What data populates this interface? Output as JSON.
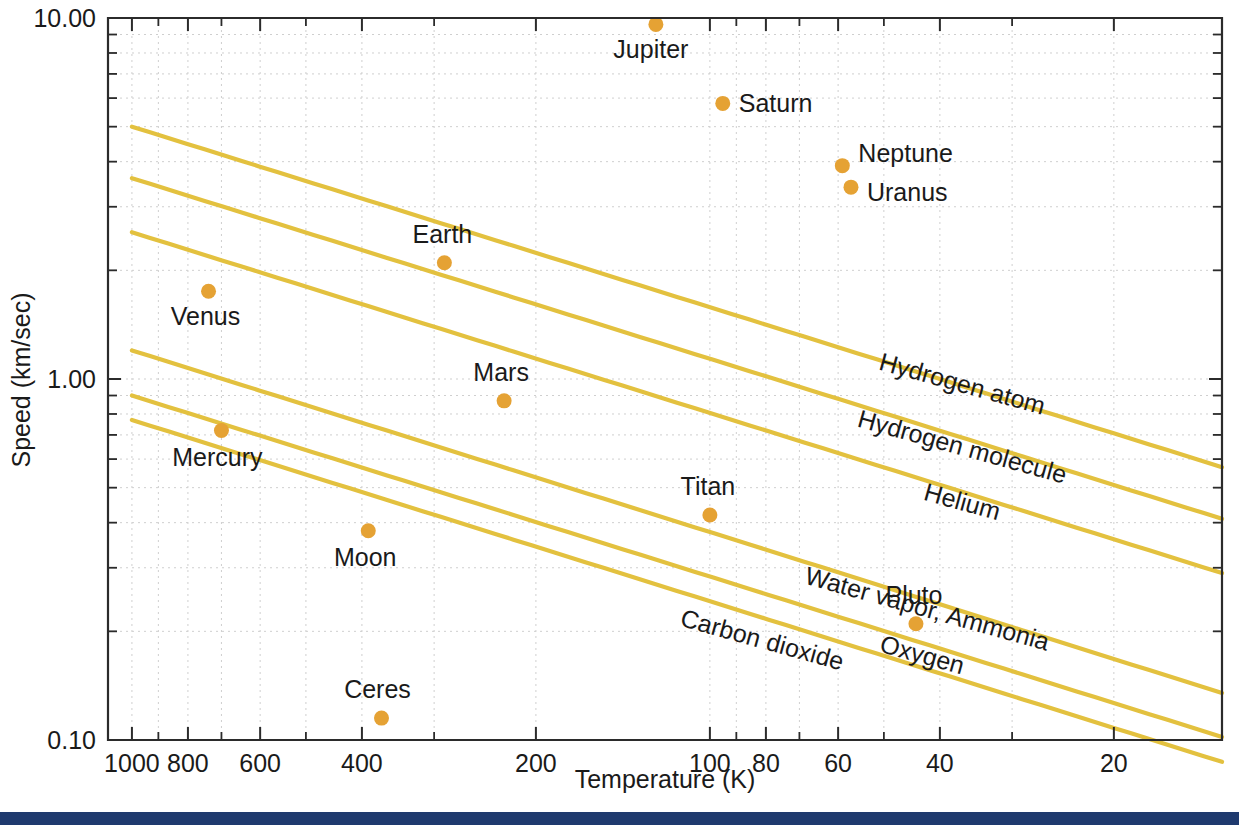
{
  "figure": {
    "background_color": "#ffffff",
    "footer_bar_color": "#1f3a6e",
    "dot_color": "#e5a234",
    "line_color": "#e3c13f",
    "axis_color": "#2b2b2b",
    "grid_color": "#cfcfcf"
  },
  "chart_data": {
    "type": "scatter",
    "title": "",
    "xlabel": "Temperature (K)",
    "ylabel": "Speed (km/sec)",
    "xscale": "log",
    "yscale": "log",
    "x_reversed": true,
    "xlim": [
      1100,
      13
    ],
    "ylim": [
      0.1,
      10.0
    ],
    "grid": true,
    "legend_position": "inline-curve-labels",
    "x_tick_labels": [
      "1000",
      "800",
      "600",
      "400",
      "200",
      "100",
      "80",
      "60",
      "40",
      "20"
    ],
    "x_tick_values": [
      1000,
      800,
      600,
      400,
      200,
      100,
      80,
      60,
      40,
      20
    ],
    "y_tick_labels": [
      "10.00",
      "1.00",
      "0.10"
    ],
    "y_tick_values": [
      10.0,
      1.0,
      0.1
    ],
    "y_minor_ticks": [
      9,
      8,
      7,
      6,
      5,
      4,
      3,
      2,
      0.9,
      0.8,
      0.7,
      0.6,
      0.5,
      0.4,
      0.3,
      0.2
    ],
    "points": [
      {
        "name": "Jupiter",
        "temperature": 124,
        "speed": 9.6,
        "label_dx": -5,
        "label_dy": 34,
        "label_anchor": "middle"
      },
      {
        "name": "Saturn",
        "temperature": 95,
        "speed": 5.8,
        "label_dx": 16,
        "label_dy": 9,
        "label_anchor": "start"
      },
      {
        "name": "Neptune",
        "temperature": 59,
        "speed": 3.9,
        "label_dx": 16,
        "label_dy": -4,
        "label_anchor": "start"
      },
      {
        "name": "Uranus",
        "temperature": 57,
        "speed": 3.4,
        "label_dx": 16,
        "label_dy": 14,
        "label_anchor": "start"
      },
      {
        "name": "Earth",
        "temperature": 288,
        "speed": 2.1,
        "label_dx": -2,
        "label_dy": -20,
        "label_anchor": "middle"
      },
      {
        "name": "Venus",
        "temperature": 737,
        "speed": 1.75,
        "label_dx": -3,
        "label_dy": 34,
        "label_anchor": "middle"
      },
      {
        "name": "Mercury",
        "temperature": 700,
        "speed": 0.72,
        "label_dx": -4,
        "label_dy": 35,
        "label_anchor": "middle"
      },
      {
        "name": "Mars",
        "temperature": 227,
        "speed": 0.87,
        "label_dx": -3,
        "label_dy": -20,
        "label_anchor": "middle"
      },
      {
        "name": "Titan",
        "temperature": 100,
        "speed": 0.42,
        "label_dx": -2,
        "label_dy": -20,
        "label_anchor": "middle"
      },
      {
        "name": "Moon",
        "temperature": 390,
        "speed": 0.38,
        "label_dx": -3,
        "label_dy": 35,
        "label_anchor": "middle"
      },
      {
        "name": "Pluto",
        "temperature": 44,
        "speed": 0.21,
        "label_dx": -2,
        "label_dy": -20,
        "label_anchor": "middle"
      },
      {
        "name": "Ceres",
        "temperature": 370,
        "speed": 0.115,
        "label_dx": -4,
        "label_dy": -20,
        "label_anchor": "middle"
      }
    ],
    "curves": [
      {
        "name": "Hydrogen atom",
        "molar_mass": 1.0,
        "x_start": 1000,
        "y_start": 5.0,
        "x_end": 13,
        "y_end": 0.57,
        "label_x": 960,
        "label_y": 392,
        "label_rotation": 15.5
      },
      {
        "name": "Hydrogen molecule",
        "molar_mass": 2.0,
        "x_start": 1000,
        "y_start": 3.6,
        "x_end": 13,
        "y_end": 0.41,
        "label_x": 960,
        "label_y": 455,
        "label_rotation": 15.5
      },
      {
        "name": "Helium",
        "molar_mass": 4.0,
        "x_start": 1000,
        "y_start": 2.55,
        "x_end": 13,
        "y_end": 0.29,
        "label_x": 960,
        "label_y": 510,
        "label_rotation": 15.5
      },
      {
        "name": "Water vapor, Ammonia",
        "molar_mass": 18.0,
        "x_start": 1000,
        "y_start": 1.2,
        "x_end": 13,
        "y_end": 0.135,
        "label_x": 925,
        "label_y": 617,
        "label_rotation": 15.5
      },
      {
        "name": "Oxygen",
        "molar_mass": 32.0,
        "x_start": 1000,
        "y_start": 0.9,
        "x_end": 13,
        "y_end": 0.102,
        "label_x": 920,
        "label_y": 663,
        "label_rotation": 15.5
      },
      {
        "name": "Carbon dioxide",
        "molar_mass": 44.0,
        "x_start": 1000,
        "y_start": 0.77,
        "x_end": 13,
        "y_end": 0.087,
        "label_x": 760,
        "label_y": 648,
        "label_rotation": 15.5
      }
    ]
  }
}
